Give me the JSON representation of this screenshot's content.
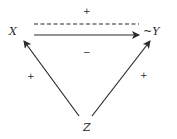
{
  "diagram": {
    "nodes": {
      "x": {
        "label": "X"
      },
      "y": {
        "label": "~Y"
      },
      "z": {
        "label": "Z"
      }
    },
    "edges": {
      "x_to_y_dashed": {
        "from": "X",
        "to": "~Y",
        "style": "dashed",
        "sign": "+"
      },
      "x_to_y_solid": {
        "from": "X",
        "to": "~Y",
        "style": "solid-arrow",
        "sign": "−"
      },
      "z_to_x": {
        "from": "Z",
        "to": "X",
        "style": "solid-arrow",
        "sign": "+"
      },
      "z_to_y": {
        "from": "Z",
        "to": "~Y",
        "style": "solid-arrow",
        "sign": "+"
      }
    }
  }
}
